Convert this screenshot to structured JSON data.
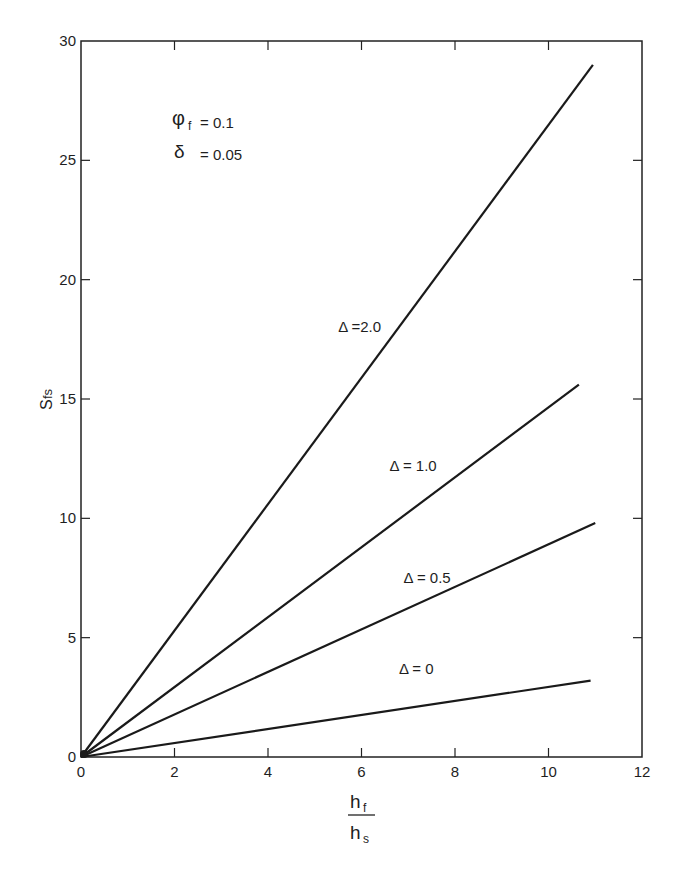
{
  "chart_data": {
    "type": "line",
    "title": "",
    "xlabel": "h_f / h_s",
    "xlabel_numerator": "h",
    "xlabel_numerator_sub": "f",
    "xlabel_denominator": "h",
    "xlabel_denominator_sub": "s",
    "ylabel": "S_fs",
    "ylabel_main": "S",
    "ylabel_sub": "fs",
    "xlim": [
      0,
      12
    ],
    "ylim": [
      0,
      30
    ],
    "xticks": [
      0,
      2,
      4,
      6,
      8,
      10,
      12
    ],
    "yticks": [
      0,
      5,
      10,
      15,
      20,
      25,
      30
    ],
    "grid": false,
    "parameters": [
      {
        "symbol": "φ",
        "sub": "f",
        "text": "= 0.1"
      },
      {
        "symbol": "δ",
        "sub": "",
        "text": "= 0.05"
      }
    ],
    "series": [
      {
        "name": "Δ = 2.0",
        "label": "Δ =2.0",
        "x": [
          0,
          10.95
        ],
        "y": [
          0,
          29.0
        ],
        "label_pos": [
          5.5,
          18.0
        ]
      },
      {
        "name": "Δ = 1.0",
        "label": "Δ = 1.0",
        "x": [
          0,
          10.65
        ],
        "y": [
          0,
          15.6
        ],
        "label_pos": [
          6.6,
          12.2
        ]
      },
      {
        "name": "Δ = 0.5",
        "label": "Δ = 0.5",
        "x": [
          0,
          11.0
        ],
        "y": [
          0,
          9.8
        ],
        "label_pos": [
          6.9,
          7.5
        ]
      },
      {
        "name": "Δ = 0",
        "label": "Δ = 0",
        "x": [
          0,
          10.9
        ],
        "y": [
          0,
          3.2
        ],
        "label_pos": [
          6.8,
          3.7
        ]
      }
    ]
  },
  "colors": {
    "line": "#1a1a1a",
    "axis": "#222222",
    "background": "#ffffff"
  }
}
